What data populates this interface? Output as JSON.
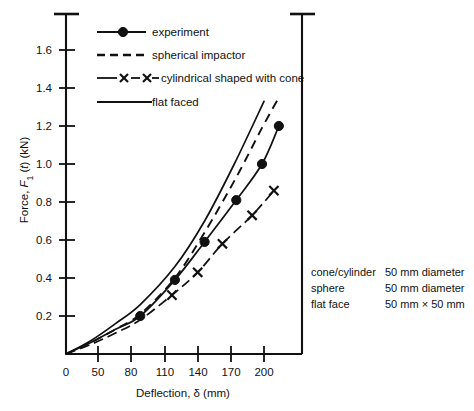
{
  "chart_data": {
    "type": "line",
    "title": "",
    "xlabel": "Deflection, δ (mm)",
    "ylabel": "Force, F₁ (t) (kN)",
    "xlim": [
      0,
      230
    ],
    "ylim": [
      0,
      1.75
    ],
    "xticks": [
      0,
      50,
      80,
      110,
      140,
      170,
      200
    ],
    "xticklabels": [
      "0",
      "50",
      "80",
      "110",
      "140",
      "170",
      "200"
    ],
    "yticks": [
      0.2,
      0.4,
      0.6,
      0.8,
      1.0,
      1.2,
      1.4,
      1.6
    ],
    "yticklabels": [
      "0.2",
      "0.4",
      "0.6",
      "0.8",
      "1.0",
      "1.2",
      "1.4",
      "1.6"
    ],
    "grid": false,
    "legend_position": "top-left",
    "series": [
      {
        "name": "experiment",
        "style": "solid-with-dots",
        "marker": "filled-circle",
        "x": [
          0,
          25,
          50,
          75,
          110,
          140,
          172,
          198,
          215
        ],
        "y": [
          0.0,
          0.06,
          0.13,
          0.2,
          0.39,
          0.59,
          0.81,
          1.0,
          1.2
        ]
      },
      {
        "name": "spherical impactor",
        "style": "dashed",
        "marker": "none",
        "x": [
          0,
          25,
          50,
          75,
          110,
          140,
          172,
          198,
          215
        ],
        "y": [
          0.0,
          0.06,
          0.13,
          0.21,
          0.4,
          0.64,
          0.93,
          1.19,
          1.35
        ]
      },
      {
        "name": "cylindrical shaped with cone",
        "style": "dashed-with-crosses",
        "marker": "cross",
        "x": [
          0,
          25,
          50,
          75,
          107,
          133,
          158,
          188,
          210
        ],
        "y": [
          0.0,
          0.05,
          0.11,
          0.18,
          0.31,
          0.43,
          0.58,
          0.73,
          0.86
        ]
      },
      {
        "name": "flat faced",
        "style": "solid",
        "marker": "none",
        "x": [
          0,
          25,
          50,
          75,
          110,
          140,
          170,
          200
        ],
        "y": [
          0.0,
          0.07,
          0.16,
          0.26,
          0.46,
          0.7,
          1.0,
          1.33
        ]
      }
    ],
    "annotations": [
      {
        "label": "cone/cylinder",
        "value": "50 mm diameter"
      },
      {
        "label": "sphere",
        "value": "50 mm diameter"
      },
      {
        "label": "flat face",
        "value": "50 mm × 50 mm"
      }
    ]
  },
  "legend": {
    "items": [
      {
        "label": "experiment",
        "style": "solid-with-dots"
      },
      {
        "label": "spherical impactor",
        "style": "dashed"
      },
      {
        "label": "cylindrical shaped with cone",
        "style": "dashed-with-crosses"
      },
      {
        "label": "flat faced",
        "style": "solid"
      }
    ]
  },
  "colors": {
    "ink": "#111111",
    "background": "#ffffff"
  }
}
